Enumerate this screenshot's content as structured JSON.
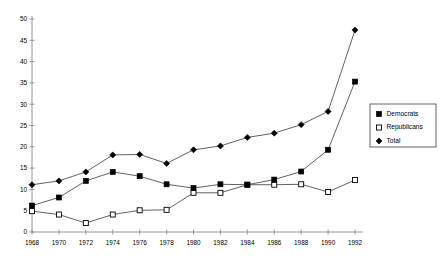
{
  "chart_data": {
    "type": "line",
    "title": "",
    "subtitle": "",
    "xlabel": "",
    "ylabel": "",
    "x": [
      1968,
      1970,
      1972,
      1974,
      1976,
      1978,
      1980,
      1982,
      1984,
      1986,
      1988,
      1990,
      1992
    ],
    "xtick_labels": [
      "1968",
      "1970",
      "1972",
      "1974",
      "1976",
      "1978",
      "1980",
      "1982",
      "1984",
      "1986",
      "1988",
      "1990",
      "1992"
    ],
    "xlim": [
      1968,
      1992
    ],
    "ylim": [
      0,
      50
    ],
    "ytick_values": [
      0,
      5,
      10,
      15,
      20,
      25,
      30,
      35,
      40,
      45,
      50
    ],
    "ytick_labels": [
      "0",
      "5",
      "10",
      "15",
      "20",
      "25",
      "30",
      "35",
      "40",
      "45",
      "50"
    ],
    "grid": false,
    "legend_position": "right",
    "series": [
      {
        "name": "Democrats",
        "marker": "filled-square",
        "color": "#000000",
        "values": [
          6.2,
          8.1,
          12.0,
          14.1,
          13.1,
          11.2,
          10.3,
          11.2,
          11.1,
          12.3,
          14.2,
          19.3,
          35.3
        ]
      },
      {
        "name": "Republicans",
        "marker": "open-square",
        "color": "#ffffff",
        "values": [
          4.9,
          4.1,
          2.1,
          4.1,
          5.1,
          5.2,
          9.2,
          9.2,
          11.1,
          11.1,
          11.2,
          9.4,
          12.2
        ]
      },
      {
        "name": "Total",
        "marker": "filled-diamond",
        "color": "#000000",
        "values": [
          11.1,
          12.0,
          14.1,
          18.1,
          18.2,
          16.1,
          19.3,
          20.2,
          22.2,
          23.2,
          25.2,
          28.3,
          47.4
        ]
      }
    ]
  },
  "legend": {
    "entries": [
      {
        "label": "Democrats",
        "marker": "filled-square"
      },
      {
        "label": "Republicans",
        "marker": "open-square"
      },
      {
        "label": "Total",
        "marker": "filled-diamond"
      }
    ]
  }
}
